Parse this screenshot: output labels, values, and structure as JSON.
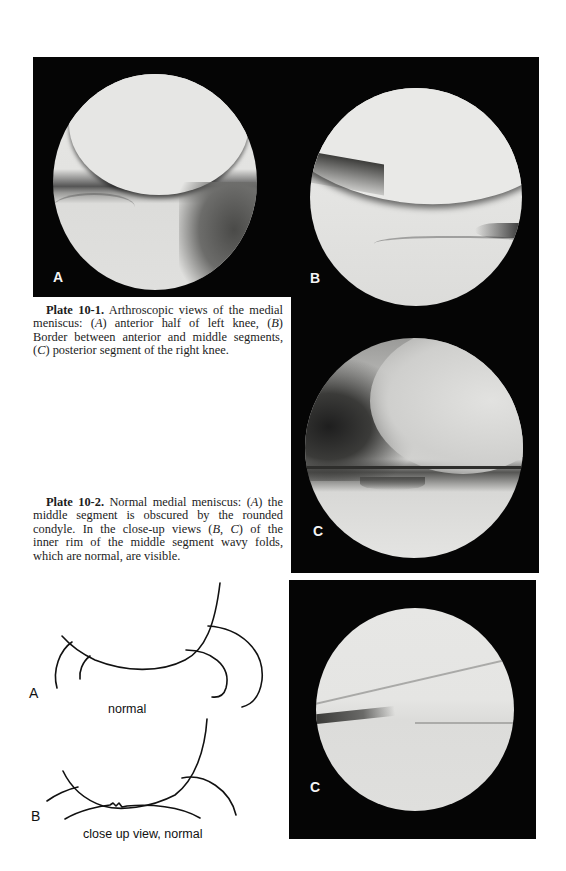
{
  "page": {
    "background": "#ffffff",
    "panel_color": "#050505"
  },
  "figures": {
    "plate_10_1": {
      "panels": [
        {
          "id": "A",
          "label": "A",
          "description": "anterior half of left knee"
        },
        {
          "id": "B",
          "label": "B",
          "description": "border between anterior and middle segments"
        },
        {
          "id": "C1",
          "label": "C",
          "description": "posterior segment of the right knee"
        }
      ]
    },
    "plate_10_2": {
      "panels": [
        {
          "id": "C2",
          "label": "C",
          "description": "close-up view of inner rim of middle segment"
        }
      ]
    }
  },
  "captions": {
    "plate_10_1": {
      "lead": "Plate 10-1.",
      "line1_rest": " Arthroscopic views of the medial",
      "line2a": "meniscus: (",
      "line2_A": "A",
      "line2b": ") anterior half of left knee, (",
      "line2_B": "B",
      "line2c": ")",
      "line3": "Border between anterior and middle segments,",
      "line4a": "(",
      "line4_C": "C",
      "line4b": ") posterior segment of the right knee."
    },
    "plate_10_2": {
      "lead": "Plate 10-2.",
      "line1a": " Normal medial meniscus: (",
      "line1_A": "A",
      "line1b": ") the",
      "line2": "middle segment is obscured by the rounded",
      "line3a": "condyle. In the close-up views (",
      "line3_B": "B",
      "line3b": ", ",
      "line3_C": "C",
      "line3c": ") of the",
      "line4": "inner rim of the middle segment wavy folds,",
      "line5": "which are normal, are visible."
    }
  },
  "sketches": {
    "A": {
      "label": "A",
      "caption": "normal"
    },
    "B": {
      "label": "B",
      "caption": "close up view, normal"
    }
  }
}
